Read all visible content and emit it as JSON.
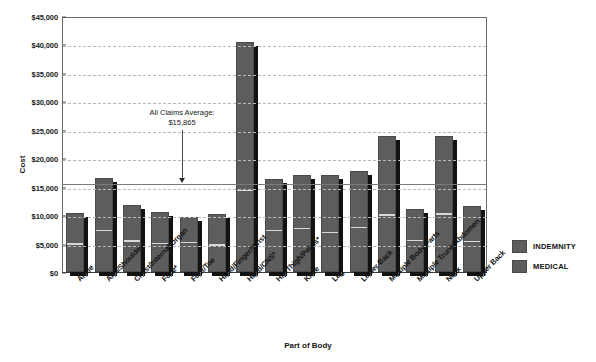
{
  "chart_data": {
    "type": "bar",
    "title": "",
    "xlabel": "Part of Body",
    "ylabel": "Cost",
    "ylim": [
      0,
      45000
    ],
    "ytick_labels": [
      "$45,000",
      "$40,000",
      "$35,000",
      "$30,000",
      "$25,000",
      "$20,000",
      "$15,000",
      "$10,000",
      "$5,000",
      "$0"
    ],
    "ytick_values": [
      45000,
      40000,
      35000,
      30000,
      25000,
      20000,
      15000,
      10000,
      5000,
      0
    ],
    "grid": true,
    "legend_position": "right",
    "stacked": true,
    "categories": [
      "Ankle",
      "Arm/Shoulder",
      "Chest/Internal Organ",
      "Face*",
      "Foot/Toe",
      "Hand/Finger/Wrist",
      "Head/CNS*",
      "Hip/Thigh/Pelvis*",
      "Knee",
      "Leg",
      "Lower Back",
      "Multiple Body Parts",
      "Multiple Trunk/Abdomen",
      "Neck",
      "Upper Back"
    ],
    "values": [
      10358,
      16564,
      11759,
      10547,
      9588,
      10243,
      40392,
      16279,
      16966,
      17034,
      17738,
      23903,
      11005,
      23862,
      11533
    ],
    "value_labels": [
      "10,358",
      "16,564",
      "11,759",
      "10,547",
      "9,588",
      "10,243",
      "40,392",
      "16,279",
      "16,966",
      "17,034",
      "17,738",
      "23,903",
      "11,005",
      "23,862",
      "11,533"
    ],
    "series": [
      {
        "name": "INDEMNITY",
        "values": [
          5700,
          9600,
          6600,
          5800,
          4700,
          5800,
          26400,
          9300,
          9600,
          10400,
          10200,
          14200,
          5800,
          14000,
          6500
        ]
      },
      {
        "name": "MEDICAL",
        "values": [
          4658,
          6964,
          5159,
          4747,
          4888,
          4443,
          13992,
          6979,
          7366,
          6634,
          7538,
          9703,
          5205,
          9862,
          5033
        ]
      }
    ],
    "annotation": {
      "line1": "All Claims Average:",
      "line2": "$15,865",
      "value": 15865
    }
  },
  "legend": {
    "items": [
      {
        "label": "INDEMNITY",
        "color": "#5d5d5d"
      },
      {
        "label": "MEDICAL",
        "color": "#5d5d5d"
      }
    ]
  }
}
